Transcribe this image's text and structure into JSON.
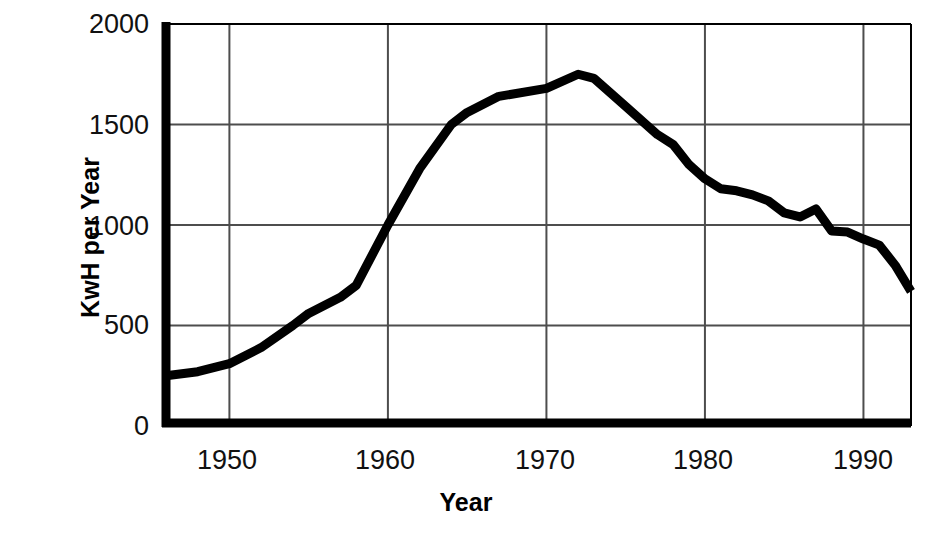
{
  "chart_data": {
    "type": "line",
    "title": "",
    "subtitle": "",
    "xlabel": "Year",
    "ylabel": "KwH per Year",
    "xlim": [
      1946,
      1993
    ],
    "ylim": [
      0,
      2000
    ],
    "xticks": [
      1950,
      1960,
      1970,
      1980,
      1990
    ],
    "xtick_labels": [
      "1950",
      "1960",
      "1970",
      "1980",
      "1990"
    ],
    "yticks": [
      0,
      500,
      1000,
      1500,
      2000
    ],
    "ytick_labels": [
      "0",
      "500",
      "1000",
      "1500",
      "2000"
    ],
    "grid": true,
    "grid_axes": "both",
    "legend": false,
    "legend_position": "none",
    "line_color": "#000000",
    "line_width": 9,
    "axis_color": "#000000",
    "grid_color": "#4d4d4d",
    "series": [
      {
        "name": "KwH per Year",
        "x": [
          1946,
          1948,
          1950,
          1952,
          1954,
          1955,
          1957,
          1958,
          1960,
          1962,
          1964,
          1965,
          1967,
          1970,
          1972,
          1973,
          1975,
          1977,
          1978,
          1979,
          1980,
          1981,
          1982,
          1983,
          1984,
          1985,
          1986,
          1987,
          1988,
          1989,
          1990,
          1991,
          1992,
          1993
        ],
        "values": [
          250,
          270,
          310,
          390,
          500,
          560,
          640,
          700,
          1000,
          1280,
          1500,
          1560,
          1640,
          1680,
          1750,
          1730,
          1590,
          1450,
          1400,
          1300,
          1230,
          1180,
          1170,
          1150,
          1120,
          1060,
          1040,
          1080,
          970,
          965,
          930,
          900,
          800,
          670
        ]
      }
    ],
    "annotations": []
  },
  "axes": {
    "y_title": "KwH per Year",
    "x_title": "Year",
    "y_labels": [
      "2000",
      "1500",
      "1000",
      "500",
      "0"
    ],
    "x_labels": [
      "1950",
      "1960",
      "1970",
      "1980",
      "1990"
    ]
  }
}
